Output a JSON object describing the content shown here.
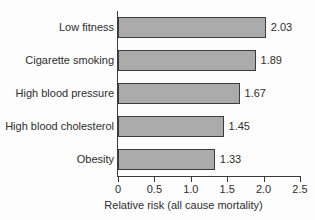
{
  "chart_data": {
    "type": "bar",
    "orientation": "horizontal",
    "title": "",
    "subtitle": "",
    "xlabel": "Relative risk (all cause mortality)",
    "ylabel": "",
    "categories": [
      "Low fitness",
      "Cigarette smoking",
      "High blood pressure",
      "High blood cholesterol",
      "Obesity"
    ],
    "values": [
      2.03,
      1.89,
      1.67,
      1.45,
      1.33
    ],
    "value_labels": [
      "2.03",
      "1.89",
      "1.67",
      "1.45",
      "1.33"
    ],
    "xlim": [
      0,
      2.5
    ],
    "xticks": [
      0,
      0.5,
      1.0,
      1.5,
      2.0,
      2.5
    ],
    "xtick_labels": [
      "0",
      "0.5",
      "1.0",
      "1.5",
      "2.0",
      "2.5"
    ],
    "grid": false,
    "legend": null,
    "legend_position": "none",
    "bar_fill_color": "#ababab",
    "bar_edge_color": "#3d3d3d",
    "axis_color": "#3a3a3a",
    "text_color": "#2d2d2d",
    "background_color": "#fdfdfd"
  }
}
